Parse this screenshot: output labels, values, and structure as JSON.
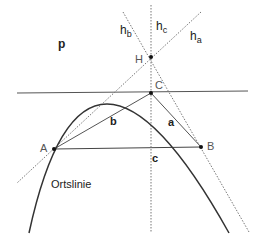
{
  "diagram": {
    "labels": {
      "parabola": "p",
      "altitude_b": "h",
      "altitude_b_sub": "b",
      "altitude_c": "h",
      "altitude_c_sub": "c",
      "altitude_a": "h",
      "altitude_a_sub": "a",
      "orthocenter": "H",
      "point_c": "C",
      "point_a": "A",
      "point_b": "B",
      "side_a": "a",
      "side_b": "b",
      "side_c": "c",
      "locus": "Ortslinie"
    },
    "points": {
      "A": [
        54,
        149
      ],
      "B": [
        201,
        147
      ],
      "C": [
        151,
        93
      ],
      "H": [
        151,
        57
      ]
    },
    "colors": {
      "solid": "#333333",
      "dotted": "#777777",
      "point": "#111111"
    }
  }
}
